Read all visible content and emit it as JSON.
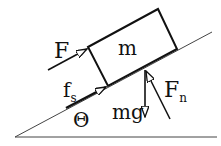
{
  "diagram": {
    "labels": {
      "mass": "m",
      "applied_force": "F",
      "static_friction_main": "f",
      "static_friction_sub": "s",
      "angle": "Θ",
      "weight": "mg",
      "normal_force_main": "F",
      "normal_force_sub": "n"
    },
    "colors": {
      "stroke": "#111111",
      "incline": "#444444",
      "background": "#ffffff"
    }
  }
}
